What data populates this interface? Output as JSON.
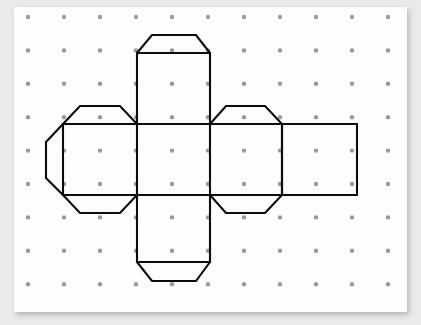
{
  "figure": {
    "paper": {
      "background_color": "#fdfdfd",
      "page_background_color": "#e9eaea",
      "left": 14,
      "top": 7,
      "width": 393,
      "height": 305
    },
    "grid": {
      "dot_color": "#9a9a9e",
      "dot_radius": 2.2,
      "columns": 11,
      "rows": 9,
      "x_start": 28,
      "y_start": 17,
      "x_spacing": 36,
      "y_spacing": 33.4
    },
    "line_color": "#0c0c0c",
    "line_width": 2.1,
    "squares": [
      {
        "name": "face-left",
        "x": 63,
        "y": 124,
        "w": 74,
        "h": 71
      },
      {
        "name": "face-center",
        "x": 137,
        "y": 124,
        "w": 73,
        "h": 71
      },
      {
        "name": "face-right",
        "x": 210,
        "y": 124,
        "w": 72,
        "h": 71
      },
      {
        "name": "face-far-right",
        "x": 282,
        "y": 124,
        "w": 75,
        "h": 71
      },
      {
        "name": "face-top",
        "x": 137,
        "y": 53,
        "w": 73,
        "h": 71
      },
      {
        "name": "face-bottom",
        "x": 137,
        "y": 195,
        "w": 73,
        "h": 67
      }
    ],
    "paths": {
      "net_outline": "M 137 53 L 210 53 L 210 124 L 282 124 L 282 195 L 210 195 L 210 262 L 137 262 L 137 195 L 63 195 L 63 124 L 137 124 Z",
      "face_far_right": "M 282 124 L 357 124 L 357 195 L 282 195",
      "fold_lines": "M 137 124 L 137 195 M 210 124 L 210 195 M 282 124 L 282 195 M 63 124 L 357 124 M 63 195 L 357 195",
      "tab_top_center": "M 137 53 L 152 35 L 196 35 L 210 53",
      "tab_bottom_center": "M 137 262 L 152 281 L 196 281 L 210 262",
      "tab_left_top": "M 137 124 L 120 106 L 80 106 L 63 124",
      "tab_left_bottom": "M 137 195 L 120 213 L 80 213 L 63 195",
      "tab_left_point": "M 63 124 L 46 142 L 46 178 L 63 195",
      "tab_right_top": "M 282 124 L 265 106 L 226 106 L 210 124",
      "tab_right_bottom": "M 282 195 L 265 213 L 226 213 L 210 195"
    }
  }
}
